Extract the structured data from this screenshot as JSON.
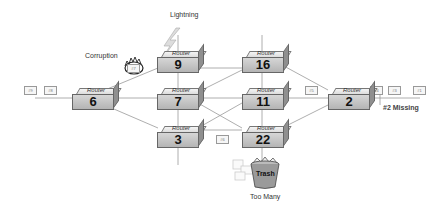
{
  "routers": [
    {
      "id": "router-9",
      "label": "Router",
      "number": "9"
    },
    {
      "id": "router-16",
      "label": "Router",
      "number": "16"
    },
    {
      "id": "router-6",
      "label": "Router",
      "number": "6"
    },
    {
      "id": "router-7",
      "label": "Router",
      "number": "7"
    },
    {
      "id": "router-11",
      "label": "Router",
      "number": "11"
    },
    {
      "id": "router-2",
      "label": "Router",
      "number": "2"
    },
    {
      "id": "router-3",
      "label": "Router",
      "number": "3"
    },
    {
      "id": "router-22",
      "label": "Router",
      "number": "22"
    }
  ],
  "packets": {
    "p9": "#9",
    "p8": "#8",
    "p7": "#7",
    "p6": "#6",
    "p5": "#5",
    "p4": "#4",
    "p3": "#3",
    "p1": "#1"
  },
  "annotations": {
    "lightning": "Lightning",
    "corruption": "Corruption",
    "missing": "#2 Missing",
    "too_many": "Too Many",
    "trash": "Trash"
  }
}
